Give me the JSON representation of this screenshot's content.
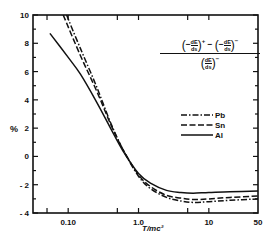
{
  "chart_data": {
    "type": "line",
    "title": "",
    "formula": {
      "numerator_left": "(−dE/ds)⁺",
      "minus": "−",
      "numerator_right": "(−dE/ds)⁻",
      "denominator": "(dE/ds)⁻",
      "dE": "dE",
      "ds": "ds",
      "sup_plus": "+",
      "sup_minus": "−"
    },
    "xlabel": "T/mc²",
    "ylabel": "%",
    "xscale": "log",
    "xlim": [
      0.0316,
      50
    ],
    "ylim": [
      -4,
      10
    ],
    "x_tick_labels": [
      "0.10",
      "1.0",
      "10",
      "50"
    ],
    "x_tick_values": [
      0.05,
      0.1,
      0.5,
      1.0,
      5,
      10,
      50
    ],
    "y_tick_labels": [
      "10",
      "8",
      "6",
      "4",
      "2",
      "0",
      "- 2",
      "- 4"
    ],
    "y_tick_values": [
      10,
      8,
      6,
      4,
      2,
      0,
      -2,
      -4
    ],
    "grid": false,
    "legend_position": "upper right (inside)",
    "legend": [
      {
        "name": "Pb",
        "style": "dash-dot"
      },
      {
        "name": "Sn",
        "style": "dashed"
      },
      {
        "name": "Al",
        "style": "solid"
      }
    ],
    "series": [
      {
        "name": "Pb",
        "style": "dash-dot",
        "x": [
          0.095,
          0.15,
          0.25,
          0.4,
          0.6,
          1.0,
          1.5,
          2.5,
          4,
          6,
          10,
          20,
          50
        ],
        "y": [
          10.0,
          7.6,
          5.0,
          2.4,
          0.5,
          -1.4,
          -2.3,
          -2.9,
          -3.15,
          -3.25,
          -3.2,
          -3.1,
          -3.0
        ]
      },
      {
        "name": "Sn",
        "style": "dashed",
        "x": [
          0.085,
          0.15,
          0.25,
          0.4,
          0.6,
          1.0,
          1.5,
          2.5,
          4,
          6,
          10,
          20,
          50
        ],
        "y": [
          10.0,
          7.1,
          4.7,
          2.3,
          0.5,
          -1.3,
          -2.15,
          -2.75,
          -2.95,
          -3.05,
          -3.0,
          -2.9,
          -2.8
        ]
      },
      {
        "name": "Al",
        "style": "solid",
        "x": [
          0.055,
          0.1,
          0.15,
          0.25,
          0.4,
          0.6,
          1.0,
          1.5,
          2.5,
          4,
          6,
          10,
          20,
          50
        ],
        "y": [
          8.7,
          7.0,
          5.8,
          3.9,
          2.0,
          0.4,
          -1.2,
          -1.9,
          -2.4,
          -2.55,
          -2.6,
          -2.55,
          -2.5,
          -2.45
        ]
      }
    ]
  }
}
